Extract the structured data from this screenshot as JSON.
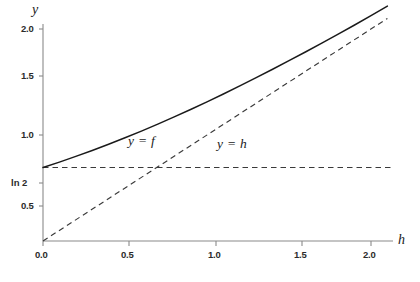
{
  "chart_data": {
    "type": "line",
    "title": "",
    "xlabel": "h",
    "ylabel": "y",
    "xlim": [
      0.0,
      2.12
    ],
    "ylim": [
      0.0,
      2.12
    ],
    "grid": false,
    "legend": "inline-annotations",
    "xticks": [
      {
        "value": 0.0,
        "label": "0.0"
      },
      {
        "value": 0.5,
        "label": "0.5"
      },
      {
        "value": 1.0,
        "label": "1.0"
      },
      {
        "value": 1.5,
        "label": "1.5"
      },
      {
        "value": 2.0,
        "label": "2.0"
      }
    ],
    "yticks": [
      {
        "value": 0.5,
        "label": "0.5"
      },
      {
        "value": 0.693,
        "label": "ln 2"
      },
      {
        "value": 1.0,
        "label": "1.0"
      },
      {
        "value": 1.5,
        "label": "1.5"
      },
      {
        "value": 2.0,
        "label": "2.0"
      }
    ],
    "series": [
      {
        "name": "y = f",
        "style": "solid",
        "color": "#1a1a1a",
        "annotation": "y = f",
        "x": [
          0.0,
          0.1,
          0.2,
          0.3,
          0.4,
          0.5,
          0.6,
          0.7,
          0.8,
          0.9,
          1.0,
          1.1,
          1.2,
          1.3,
          1.4,
          1.5,
          1.6,
          1.7,
          1.8,
          1.9,
          2.0,
          2.1
        ],
        "values": [
          0.693,
          0.744,
          0.798,
          0.854,
          0.913,
          0.974,
          1.037,
          1.103,
          1.171,
          1.241,
          1.313,
          1.387,
          1.463,
          1.541,
          1.62,
          1.701,
          1.783,
          1.867,
          1.952,
          2.038,
          2.127,
          2.216
        ]
      },
      {
        "name": "y = h",
        "style": "dashed",
        "color": "#3a3a3a",
        "annotation": "y = h",
        "x": [
          0.0,
          2.1
        ],
        "values": [
          0.0,
          2.1
        ]
      },
      {
        "name": "y = ln 2",
        "style": "dashed",
        "color": "#3a3a3a",
        "annotation": "",
        "x": [
          0.0,
          2.12
        ],
        "values": [
          0.693,
          0.693
        ]
      }
    ],
    "annotations": [
      {
        "text": "y = f",
        "x": 0.62,
        "y": 1.22
      },
      {
        "text": "y = h",
        "x": 1.1,
        "y": 1.17
      }
    ]
  },
  "axes": {
    "y_axis_label": "y",
    "x_axis_label": "h"
  }
}
